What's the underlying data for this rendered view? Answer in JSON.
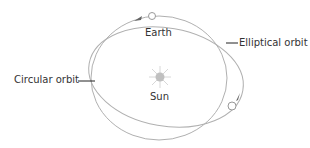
{
  "title_fragment": "",
  "labels": {
    "earth": "Earth",
    "sun": "Sun",
    "elliptical_orbit": "Elliptical orbit",
    "circular_orbit": "Circular orbit"
  },
  "colors": {
    "orbit": "#b0b0b0",
    "text": "#333333",
    "sun": "#c8c8c8",
    "leader": "#222222"
  }
}
